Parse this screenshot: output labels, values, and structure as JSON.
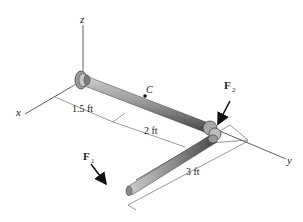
{
  "diagram": {
    "axes": {
      "x_label": "x",
      "y_label": "y",
      "z_label": "z"
    },
    "point_label": "C",
    "forces": [
      {
        "symbol": "F",
        "subscript": "1"
      },
      {
        "symbol": "F",
        "subscript": "2"
      }
    ],
    "dimensions": [
      {
        "label": "1.5 ft"
      },
      {
        "label": "2 ft"
      },
      {
        "label": "3 ft"
      }
    ],
    "colors": {
      "pipe": "#8a8a8a",
      "pipe_highlight": "#c8c8c8",
      "pipe_shadow": "#4a4a4a",
      "support_glow": "#d9b9a6",
      "line": "#333333"
    }
  }
}
